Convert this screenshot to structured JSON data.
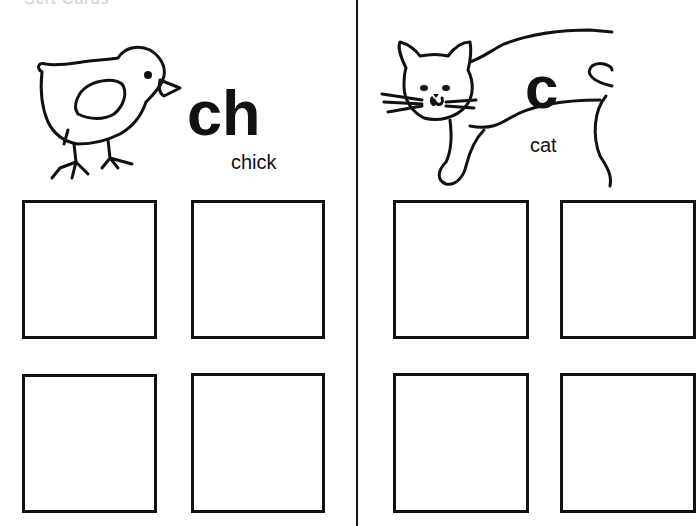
{
  "page": {
    "clipped_header": "Scrt Cards"
  },
  "panels": [
    {
      "letter": "ch",
      "word": "chick",
      "picture": "chick-illustration",
      "answer_boxes": 4
    },
    {
      "letter": "c",
      "word": "cat",
      "picture": "cat-illustration",
      "answer_boxes": 4
    }
  ]
}
